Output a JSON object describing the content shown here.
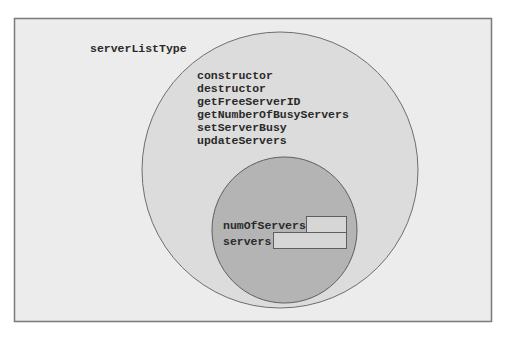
{
  "diagram": {
    "class_name": "serverListType",
    "member_functions": [
      "constructor",
      "destructor",
      "getFreeServerID",
      "getNumberOfBusyServers",
      "setServerBusy",
      "updateServers"
    ],
    "member_variables": [
      {
        "name": "numOfServers"
      },
      {
        "name": "servers"
      }
    ],
    "colors": {
      "background_panel": "#ececec",
      "outer_circle": "#dcdcdc",
      "inner_circle": "#b4b4b4",
      "field_box": "#d6d6d6",
      "border": "#6e6e6e"
    }
  }
}
